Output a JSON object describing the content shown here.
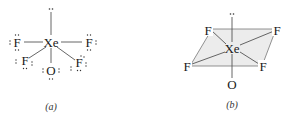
{
  "figure": {
    "panel_a": {
      "caption": "(a)",
      "type": "Lewis structure",
      "central_atom": "Xe",
      "atoms": {
        "left": "F",
        "right": "F",
        "lower_left": "F",
        "lower_right": "F",
        "bottom": "O"
      },
      "lone_pair_top": "..",
      "lone_pair_glyph": ":"
    },
    "panel_b": {
      "caption": "(b)",
      "type": "3D geometry (square pyramidal)",
      "central_atom": "Xe",
      "atoms": {
        "top_left": "F",
        "top_right": "F",
        "bottom_left": "F",
        "bottom_right": "F",
        "bottom": "O"
      },
      "lone_pair_top": ".."
    },
    "colors": {
      "text": "#1a1a1a",
      "bond": "#555555",
      "plane_fill": "#ececec"
    }
  }
}
